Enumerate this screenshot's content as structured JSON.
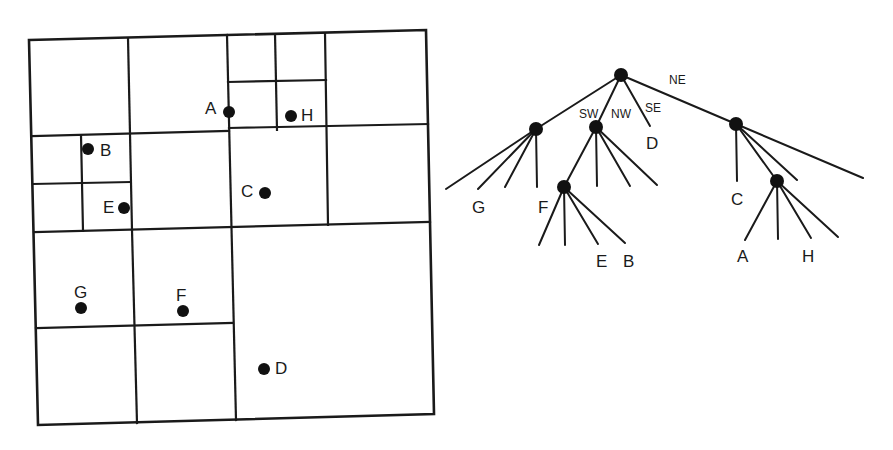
{
  "figure": {
    "colors": {
      "ink": "#1a1a1a",
      "background": "#ffffff"
    }
  },
  "region_map": {
    "points": [
      {
        "id": "A",
        "label": "A",
        "x": 229,
        "y": 112,
        "lx": 205,
        "ly": 114
      },
      {
        "id": "H",
        "label": "H",
        "x": 291,
        "y": 116,
        "lx": 301,
        "ly": 120
      },
      {
        "id": "B",
        "label": "B",
        "x": 88,
        "y": 149,
        "lx": 100,
        "ly": 156
      },
      {
        "id": "E",
        "label": "E",
        "x": 124,
        "y": 208,
        "lx": 103,
        "ly": 213
      },
      {
        "id": "C",
        "label": "C",
        "x": 265,
        "y": 193,
        "lx": 241,
        "ly": 197
      },
      {
        "id": "G",
        "label": "G",
        "x": 81,
        "y": 308,
        "lx": 74,
        "ly": 298
      },
      {
        "id": "F",
        "label": "F",
        "x": 183,
        "y": 311,
        "lx": 176,
        "ly": 301
      },
      {
        "id": "D",
        "label": "D",
        "x": 264,
        "y": 369,
        "lx": 275,
        "ly": 374
      }
    ]
  },
  "tree": {
    "quadrant_labels": {
      "sw": "SW",
      "nw": "NW",
      "se": "SE",
      "ne": "NE"
    },
    "leaf_labels": {
      "G": "G",
      "F": "F",
      "D": "D",
      "E": "E",
      "B": "B",
      "C": "C",
      "A": "A",
      "H": "H"
    }
  }
}
